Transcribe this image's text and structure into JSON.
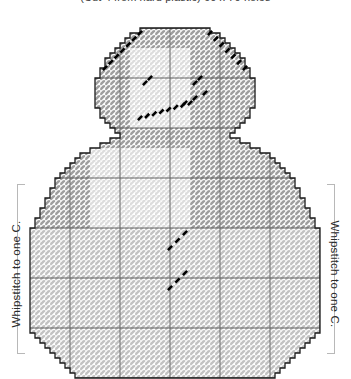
{
  "caption": {
    "top_text": "(Cut 4 from hard plastic) 60 x 70 holes",
    "note": "top caption clipped by image edge"
  },
  "annotations": {
    "left_label": "Whipstitch to one C.",
    "right_label": "Whipstitch to one C."
  },
  "chart_data": {
    "type": "heatmap",
    "xlabel": "",
    "ylabel": "",
    "grid": true,
    "legend_position": "none",
    "cell_px": 5,
    "major_grid_every": 10,
    "cols": 62,
    "rows": 70,
    "origin_x": 20,
    "origin_y": 28,
    "colors": {
      "fill_light": "#efefef",
      "fill_mid": "#c9c9c9",
      "fill_dark": "#9a9a9a",
      "outline": "#1a1a1a",
      "gridline_minor": "#d4d4d4",
      "gridline_major": "#555555",
      "backstitch": "#000000",
      "bracket": "#b8b8b8",
      "background": "#ffffff"
    },
    "shape": {
      "name": "snowman-silhouette",
      "description": "Rounded head atop a wide bell-shaped body, stepped pixel outline, chamfered bottom corners",
      "head_rows": [
        {
          "row": 0,
          "x0": 24,
          "x1": 38
        },
        {
          "row": 1,
          "x0": 22,
          "x1": 40
        },
        {
          "row": 2,
          "x0": 21,
          "x1": 41
        },
        {
          "row": 3,
          "x0": 20,
          "x1": 42
        },
        {
          "row": 4,
          "x0": 19,
          "x1": 43
        },
        {
          "row": 5,
          "x0": 18,
          "x1": 44
        },
        {
          "row": 6,
          "x0": 17,
          "x1": 45
        },
        {
          "row": 7,
          "x0": 17,
          "x1": 45
        },
        {
          "row": 8,
          "x0": 16,
          "x1": 46
        },
        {
          "row": 9,
          "x0": 16,
          "x1": 46
        },
        {
          "row": 10,
          "x0": 15,
          "x1": 47
        },
        {
          "row": 11,
          "x0": 15,
          "x1": 47
        },
        {
          "row": 12,
          "x0": 15,
          "x1": 47
        },
        {
          "row": 13,
          "x0": 15,
          "x1": 47
        },
        {
          "row": 14,
          "x0": 15,
          "x1": 47
        },
        {
          "row": 15,
          "x0": 15,
          "x1": 47
        },
        {
          "row": 16,
          "x0": 16,
          "x1": 46
        },
        {
          "row": 17,
          "x0": 16,
          "x1": 46
        },
        {
          "row": 18,
          "x0": 17,
          "x1": 45
        },
        {
          "row": 19,
          "x0": 18,
          "x1": 44
        },
        {
          "row": 20,
          "x0": 19,
          "x1": 43
        },
        {
          "row": 21,
          "x0": 20,
          "x1": 42
        }
      ],
      "body_rows": [
        {
          "row": 22,
          "x0": 18,
          "x1": 44
        },
        {
          "row": 23,
          "x0": 16,
          "x1": 46
        },
        {
          "row": 24,
          "x0": 14,
          "x1": 48
        },
        {
          "row": 25,
          "x0": 12,
          "x1": 50
        },
        {
          "row": 26,
          "x0": 11,
          "x1": 51
        },
        {
          "row": 27,
          "x0": 10,
          "x1": 52
        },
        {
          "row": 28,
          "x0": 9,
          "x1": 53
        },
        {
          "row": 29,
          "x0": 8,
          "x1": 54
        },
        {
          "row": 30,
          "x0": 7,
          "x1": 55
        },
        {
          "row": 31,
          "x0": 7,
          "x1": 55
        },
        {
          "row": 32,
          "x0": 6,
          "x1": 56
        },
        {
          "row": 33,
          "x0": 6,
          "x1": 56
        },
        {
          "row": 34,
          "x0": 5,
          "x1": 57
        },
        {
          "row": 35,
          "x0": 5,
          "x1": 57
        },
        {
          "row": 36,
          "x0": 4,
          "x1": 58
        },
        {
          "row": 37,
          "x0": 4,
          "x1": 58
        },
        {
          "row": 38,
          "x0": 3,
          "x1": 59
        },
        {
          "row": 39,
          "x0": 3,
          "x1": 59
        },
        {
          "row": 40,
          "x0": 2,
          "x1": 60
        },
        {
          "row": 41,
          "x0": 2,
          "x1": 60
        },
        {
          "row": 42,
          "x0": 2,
          "x1": 60
        },
        {
          "row": 43,
          "x0": 2,
          "x1": 60
        },
        {
          "row": 44,
          "x0": 2,
          "x1": 60
        },
        {
          "row": 45,
          "x0": 2,
          "x1": 60
        },
        {
          "row": 46,
          "x0": 2,
          "x1": 60
        },
        {
          "row": 47,
          "x0": 2,
          "x1": 60
        },
        {
          "row": 48,
          "x0": 2,
          "x1": 60
        },
        {
          "row": 49,
          "x0": 2,
          "x1": 60
        },
        {
          "row": 50,
          "x0": 2,
          "x1": 60
        },
        {
          "row": 51,
          "x0": 2,
          "x1": 60
        },
        {
          "row": 52,
          "x0": 2,
          "x1": 60
        },
        {
          "row": 53,
          "x0": 2,
          "x1": 60
        },
        {
          "row": 54,
          "x0": 2,
          "x1": 60
        },
        {
          "row": 55,
          "x0": 2,
          "x1": 60
        },
        {
          "row": 56,
          "x0": 2,
          "x1": 60
        },
        {
          "row": 57,
          "x0": 2,
          "x1": 60
        },
        {
          "row": 58,
          "x0": 2,
          "x1": 60
        },
        {
          "row": 59,
          "x0": 2,
          "x1": 60
        },
        {
          "row": 60,
          "x0": 2,
          "x1": 60
        },
        {
          "row": 61,
          "x0": 3,
          "x1": 59
        },
        {
          "row": 62,
          "x0": 4,
          "x1": 58
        },
        {
          "row": 63,
          "x0": 5,
          "x1": 57
        },
        {
          "row": 64,
          "x0": 6,
          "x1": 56
        },
        {
          "row": 65,
          "x0": 7,
          "x1": 55
        },
        {
          "row": 66,
          "x0": 8,
          "x1": 54
        },
        {
          "row": 67,
          "x0": 9,
          "x1": 53
        },
        {
          "row": 68,
          "x0": 10,
          "x1": 52
        },
        {
          "row": 69,
          "x0": 11,
          "x1": 51
        }
      ]
    },
    "backstitch_groups": [
      {
        "name": "hat-brim-left",
        "points": [
          [
            24,
            1
          ],
          [
            17,
            8
          ]
        ]
      },
      {
        "name": "hat-brim-right",
        "points": [
          [
            38,
            1
          ],
          [
            45,
            8
          ]
        ]
      },
      {
        "name": "eye-left",
        "points": [
          [
            25,
            11
          ],
          [
            26,
            10
          ]
        ]
      },
      {
        "name": "eye-right",
        "points": [
          [
            35,
            11
          ],
          [
            36,
            10
          ]
        ]
      },
      {
        "name": "nose",
        "points": [
          [
            33,
            15
          ],
          [
            37,
            13
          ]
        ]
      },
      {
        "name": "smile",
        "points": [
          [
            24,
            18
          ],
          [
            34,
            15
          ]
        ]
      },
      {
        "name": "button-upper",
        "points": [
          [
            30,
            44
          ],
          [
            33,
            41
          ]
        ]
      },
      {
        "name": "button-lower",
        "points": [
          [
            30,
            52
          ],
          [
            33,
            49
          ]
        ]
      }
    ],
    "shading_regions": [
      {
        "name": "face-highlight",
        "x0": 22,
        "y0": 4,
        "x1": 34,
        "y1": 20,
        "tone": "light"
      },
      {
        "name": "body-highlight",
        "x0": 14,
        "y0": 24,
        "x1": 34,
        "y1": 40,
        "tone": "light"
      },
      {
        "name": "body-field",
        "x0": 2,
        "y0": 40,
        "x1": 60,
        "y1": 70,
        "tone": "mid"
      }
    ]
  }
}
